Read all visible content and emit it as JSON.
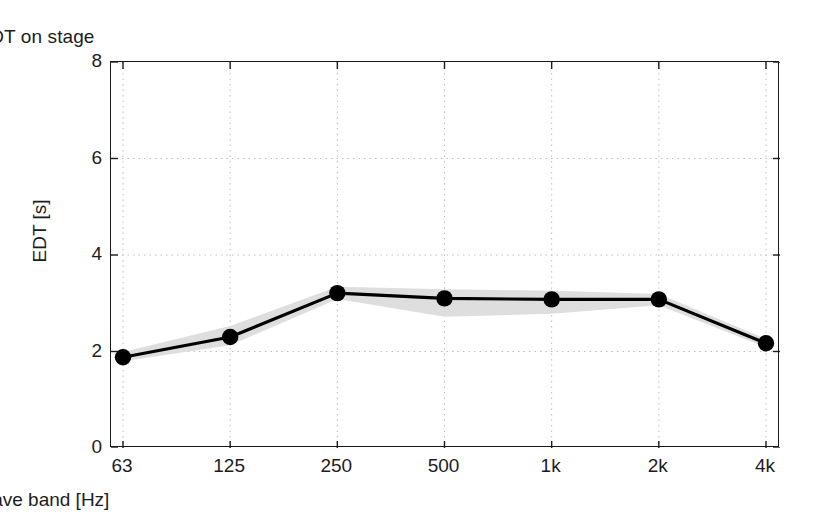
{
  "chart_data": {
    "type": "line",
    "title": "EDT on stage",
    "xlabel": "Octave band [Hz]",
    "ylabel": "EDT [s]",
    "categories": [
      "63",
      "125",
      "250",
      "500",
      "1k",
      "2k",
      "4k"
    ],
    "values": [
      1.88,
      2.3,
      3.21,
      3.1,
      3.08,
      3.08,
      2.17
    ],
    "series": [
      {
        "name": "EDT mean",
        "values": [
          1.88,
          2.3,
          3.21,
          3.1,
          3.08,
          3.08,
          2.17
        ],
        "marker": "filled-circle",
        "color": "#000000"
      },
      {
        "name": "spread band upper",
        "values": [
          1.99,
          2.53,
          3.34,
          3.29,
          3.26,
          3.19,
          2.26
        ],
        "color": "#d9d9d9"
      },
      {
        "name": "spread band lower",
        "values": [
          1.8,
          2.13,
          3.09,
          2.72,
          2.78,
          2.96,
          2.09
        ],
        "color": "#d9d9d9"
      }
    ],
    "ylim": [
      0,
      8
    ],
    "yticks": [
      0,
      2,
      4,
      6,
      8
    ],
    "ytick_labels": [
      "0",
      "2",
      "4",
      "6",
      "8"
    ],
    "xtick_labels": [
      "63",
      "125",
      "250",
      "500",
      "1k",
      "2k",
      "4k"
    ],
    "grid": "dotted-both",
    "grid_color": "#bfbfbf",
    "legend": "none",
    "axis_color": "#1a1a1a",
    "band_color": "#dcdcdc",
    "background": "#ffffff"
  }
}
